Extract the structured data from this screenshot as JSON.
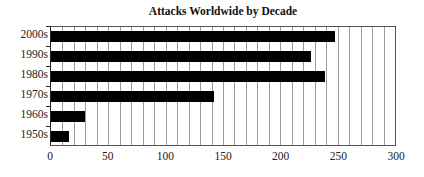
{
  "chart_data": {
    "type": "bar",
    "orientation": "horizontal",
    "title": "Attacks Worldwide by Decade",
    "categories": [
      "2000s",
      "1990s",
      "1980s",
      "1970s",
      "1960s",
      "1950s"
    ],
    "values": [
      248,
      227,
      239,
      142,
      30,
      16
    ],
    "xlabel": "",
    "ylabel": "",
    "xlim": [
      0,
      300
    ],
    "xticks": [
      0,
      50,
      100,
      150,
      200,
      250,
      300
    ],
    "grid": true,
    "grid_interval": 10,
    "bar_color": "#000000",
    "legend": null
  }
}
